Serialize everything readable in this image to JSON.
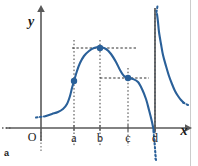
{
  "figure": {
    "panel_label": "a",
    "background_color": "#ffffff",
    "curve_color": "#2a6099",
    "axis_color": "#595959",
    "asymptote_color": "#4d4d4d",
    "dash_color": "#1a1a1a",
    "point_color": "#2a6099",
    "border_color": "#cccccc"
  },
  "axes": {
    "x_label": "x",
    "y_label": "y",
    "origin_label": "O",
    "x_axis_y": 128,
    "y_axis_x": 41
  },
  "chart_data": {
    "type": "line",
    "title": "",
    "xlabel": "x",
    "ylabel": "y",
    "grid": false,
    "legend": null,
    "xlim": [
      0,
      198
    ],
    "ylim": [
      0,
      166
    ],
    "x_tick_labels": [
      "O",
      "a",
      "b",
      "c",
      "d"
    ],
    "x_tick_positions": [
      41,
      74,
      100,
      128,
      155
    ],
    "marked_points": [
      {
        "label": "a",
        "x": 74,
        "y": 81,
        "kind": "inflection-point"
      },
      {
        "label": "b",
        "x": 100,
        "y": 48,
        "kind": "local-maximum"
      },
      {
        "label": "c",
        "x": 128,
        "y": 78,
        "kind": "inflection-point"
      }
    ],
    "vertical_asymptote": {
      "label": "d",
      "x": 155
    },
    "horizontal_dashed_lines": [
      {
        "y": 48,
        "x_from": 72,
        "x_to": 136,
        "through_label": "b"
      },
      {
        "y": 78,
        "x_from": 100,
        "x_to": 149,
        "through_label": "c"
      }
    ],
    "vertical_dashed_lines": [
      {
        "x": 74,
        "y_from": 40,
        "y_to": 146,
        "label": "a"
      },
      {
        "x": 100,
        "y_from": 40,
        "y_to": 146,
        "label": "b"
      },
      {
        "x": 128,
        "y_from": 68,
        "y_to": 146,
        "label": "c"
      },
      {
        "x": 155,
        "y_from": 10,
        "y_to": 160,
        "label": "d"
      }
    ],
    "series": [
      {
        "name": "left-branch",
        "description": "rises from lower-left through a, peaks at b, descends through c, then plunges to minus infinity at the asymptote d",
        "points": [
          [
            46,
            116
          ],
          [
            52,
            114
          ],
          [
            58,
            112
          ],
          [
            63,
            109
          ],
          [
            67,
            104
          ],
          [
            70,
            96
          ],
          [
            72,
            88
          ],
          [
            74,
            81
          ],
          [
            77,
            71
          ],
          [
            80,
            63
          ],
          [
            84,
            56
          ],
          [
            89,
            51
          ],
          [
            94,
            48
          ],
          [
            100,
            47
          ],
          [
            106,
            49
          ],
          [
            111,
            54
          ],
          [
            116,
            62
          ],
          [
            120,
            70
          ],
          [
            124,
            76
          ],
          [
            128,
            78
          ],
          [
            133,
            79
          ],
          [
            138,
            82
          ],
          [
            142,
            89
          ],
          [
            146,
            99
          ],
          [
            149,
            110
          ],
          [
            152,
            122
          ],
          [
            154,
            132
          ]
        ]
      },
      {
        "name": "right-branch",
        "description": "falls from plus infinity just right of the asymptote d toward the x-axis",
        "points": [
          [
            157,
            14
          ],
          [
            158,
            22
          ],
          [
            159,
            32
          ],
          [
            161,
            44
          ],
          [
            163,
            55
          ],
          [
            166,
            66
          ],
          [
            169,
            76
          ],
          [
            172,
            84
          ],
          [
            175,
            91
          ],
          [
            178,
            96
          ],
          [
            181,
            100
          ],
          [
            184,
            103
          ]
        ]
      }
    ]
  }
}
